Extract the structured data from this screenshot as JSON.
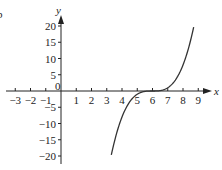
{
  "chart_data": {
    "type": "line",
    "title": "",
    "xlabel": "x",
    "ylabel": "y",
    "origin_label": "0",
    "xlim": [
      -3.4,
      9.7
    ],
    "ylim": [
      -22,
      22
    ],
    "x_ticks": [
      -3,
      -2,
      -1,
      1,
      2,
      3,
      4,
      5,
      6,
      7,
      8,
      9
    ],
    "x_tick_labels": [
      "−3",
      "−2",
      "−1",
      "1",
      "2",
      "3",
      "4",
      "5",
      "6",
      "7",
      "8",
      "9"
    ],
    "y_ticks": [
      20,
      15,
      10,
      5,
      -5,
      -10,
      -15,
      -20
    ],
    "y_tick_labels": [
      "20",
      "15",
      "10",
      "5",
      "−5",
      "−10",
      "−15",
      "−20"
    ],
    "grid": false,
    "legend": null,
    "series": [
      {
        "name": "y = (x − 6)^3",
        "x": [
          3.3,
          3.6,
          4.0,
          4.5,
          5.0,
          5.5,
          6.0,
          6.5,
          7.0,
          7.5,
          8.0,
          8.4,
          8.7
        ],
        "y": [
          -19.7,
          -13.8,
          -8.0,
          -3.4,
          -1.0,
          -0.1,
          0.0,
          0.1,
          1.0,
          3.4,
          8.0,
          13.8,
          19.7
        ]
      }
    ],
    "annotations": [
      "b"
    ]
  },
  "colors": {
    "axis": "#222222",
    "curve": "#333333",
    "background": "#ffffff"
  }
}
